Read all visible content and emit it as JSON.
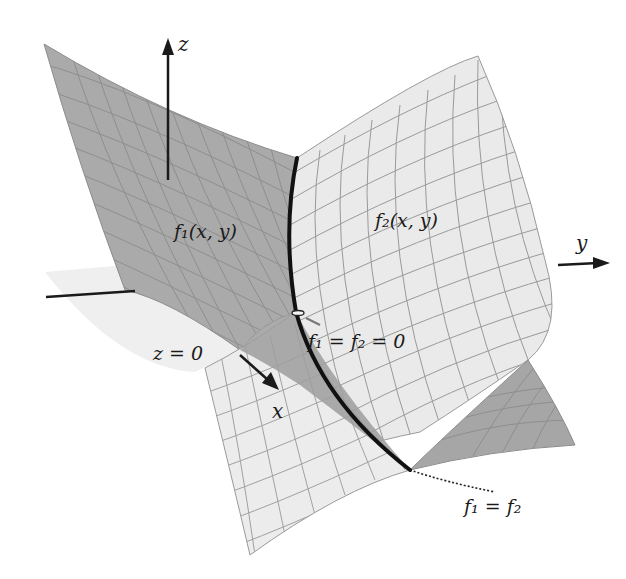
{
  "figure": {
    "type": "3d-surface-diagram",
    "axes": {
      "z_label": "z",
      "y_label": "y",
      "x_label": "x"
    },
    "surfaces": {
      "f1_label": "f₁(x, y)",
      "f2_label": "f₂(x, y)",
      "plane_label": "z = 0"
    },
    "annotations": {
      "intersection_zero": "f₁ = f₂ = 0",
      "intersection_curve": "f₁ = f₂"
    },
    "colors": {
      "f1_surface": "#a9a9a9",
      "f1_surface_dark": "#9a9a9a",
      "f2_surface": "#e9e9e9",
      "plane": "#eeeeee",
      "grid_line": "#8a8a8a",
      "curve": "#111111",
      "axis": "#1a1a1a"
    }
  }
}
